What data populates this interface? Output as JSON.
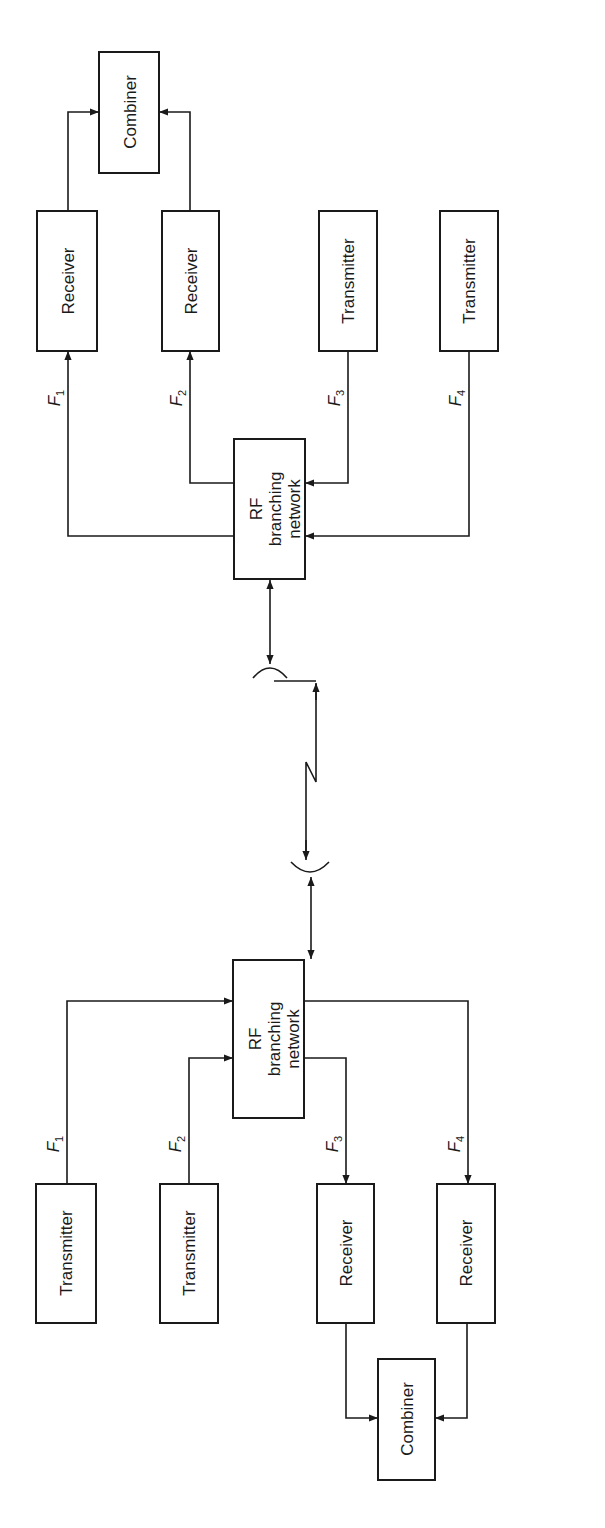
{
  "diagram": {
    "orientation": "rotated-90",
    "station_a": {
      "combiner": {
        "label": "Combiner"
      },
      "blocks": [
        {
          "label": "Receiver",
          "freq": "F",
          "sub": "1"
        },
        {
          "label": "Receiver",
          "freq": "F",
          "sub": "2"
        },
        {
          "label": "Transmitter",
          "freq": "F",
          "sub": "3"
        },
        {
          "label": "Transmitter",
          "freq": "F",
          "sub": "4"
        }
      ],
      "rf_network": {
        "line1": "RF",
        "line2": "branching",
        "line3": "network"
      }
    },
    "station_b": {
      "combiner": {
        "label": "Combiner"
      },
      "blocks": [
        {
          "label": "Transmitter",
          "freq": "F",
          "sub": "1"
        },
        {
          "label": "Transmitter",
          "freq": "F",
          "sub": "2"
        },
        {
          "label": "Receiver",
          "freq": "F",
          "sub": "3"
        },
        {
          "label": "Receiver",
          "freq": "F",
          "sub": "4"
        }
      ],
      "rf_network": {
        "line1": "RF",
        "line2": "branching",
        "line3": "network"
      }
    },
    "colors": {
      "ink": "#1a1a1a",
      "background": "#ffffff"
    }
  }
}
